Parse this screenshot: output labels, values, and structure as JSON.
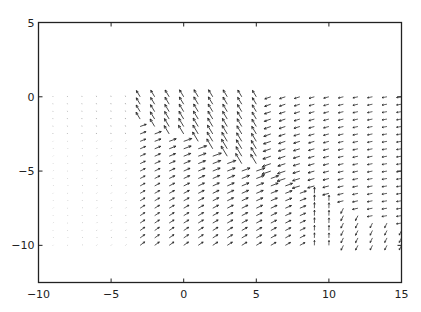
{
  "chart_data": {
    "type": "quiver",
    "title": "",
    "xlabel": "",
    "ylabel": "",
    "xlim": [
      -10,
      15
    ],
    "ylim": [
      -12.5,
      5
    ],
    "xticks": [
      -10,
      -5,
      0,
      5,
      10,
      15
    ],
    "yticks": [
      5,
      0,
      -5,
      -10
    ],
    "xtick_labels": [
      "-10",
      "-5",
      "0",
      "5",
      "10",
      "15"
    ],
    "ytick_labels": [
      "5",
      "0",
      "-5",
      "-10"
    ],
    "grid": false,
    "legend": null,
    "arrow_color": "#1a1a1a",
    "grid_points": {
      "x_start": -9,
      "x_end": 15,
      "x_step": 1,
      "y_start": 0,
      "y_end": -10,
      "y_step": -0.5
    },
    "field_description": {
      "left_region_x_lt_-3": "very small arrows, pointing slightly up-left near top, up-right lower down",
      "upper_band_above_line": "arrows point up-left (north-west), strongest near x=0..2, y=0..-2",
      "dividing_line": "from about (0,-3) to (9,-6.5)",
      "below_line_center": "arrows point right / up-right, moderate length",
      "right_upper_region_x_gt_6": "arrows point left / down-left (south-west)",
      "convergence_x_9_10_y_-7": "arrows point vertically (up), long, at x=9..10 below y=-6"
    }
  }
}
